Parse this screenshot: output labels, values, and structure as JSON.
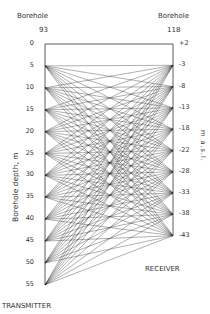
{
  "left_borehole": {
    "title": "Borehole",
    "number": "93"
  },
  "right_borehole": {
    "title": "Borehole",
    "number": "118"
  },
  "left_axis_label": "Borehole depth, m",
  "right_axis_label": "m a.s.l.",
  "transmitter_label": "TRANSMITTER",
  "receiver_label": "RECEIVER",
  "left_ticks": [
    "0",
    "5",
    "10",
    "15",
    "20",
    "25",
    "30",
    "35",
    "40",
    "45",
    "50",
    "55"
  ],
  "right_ticks": [
    "+2",
    "-3",
    "-8",
    "-13",
    "-18",
    "-22",
    "-28",
    "-33",
    "-38",
    "-43"
  ],
  "transmitter_depths": [
    5,
    10,
    15,
    20,
    25,
    30,
    35,
    40,
    45,
    50,
    55
  ],
  "receiver_levels": [
    "-3",
    "-8",
    "-13",
    "-18",
    "-22",
    "-28",
    "-33",
    "-38",
    "-43"
  ],
  "colors": {
    "line": "#1a1a1a",
    "axis": "#333333"
  }
}
